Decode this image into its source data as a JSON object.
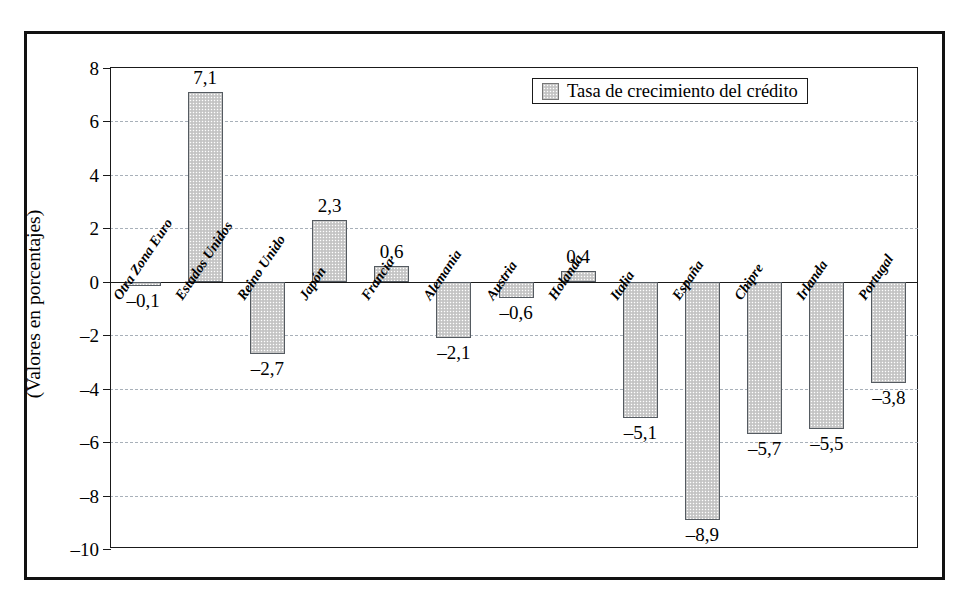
{
  "chart_data": {
    "type": "bar",
    "title": "",
    "subtitle": "",
    "xlabel": "",
    "ylabel": "(Valores en porcentajes)",
    "ylim": [
      -10,
      8
    ],
    "ytick_step": 2,
    "yticks": [
      "8",
      "6",
      "4",
      "2",
      "0",
      "–2",
      "–4",
      "–6",
      "–8",
      "–10"
    ],
    "grid": true,
    "grid_style": "dashed horizontal",
    "legend_position": "top-right inside",
    "decimal_separator": ",",
    "categories": [
      "Otra Zona Euro",
      "Estados Unidos",
      "Reino Unido",
      "Japón",
      "Francia",
      "Alemania",
      "Austria",
      "Holanda",
      "Italia",
      "España",
      "Chipre",
      "Irlanda",
      "Portugal"
    ],
    "values": [
      -0.1,
      7.1,
      -2.7,
      2.3,
      0.6,
      -2.1,
      -0.6,
      0.4,
      -5.1,
      -8.9,
      -5.7,
      -5.5,
      -3.8
    ],
    "value_labels": [
      "–0,1",
      "7,1",
      "–2,7",
      "2,3",
      "0,6",
      "–2,1",
      "–0,6",
      "0,4",
      "–5,1",
      "–8,9",
      "–5,7",
      "–5,5",
      "–3,8"
    ],
    "series": [
      {
        "name": "Tasa de crecimiento del crédito",
        "values": [
          -0.1,
          7.1,
          -2.7,
          2.3,
          0.6,
          -2.1,
          -0.6,
          0.4,
          -5.1,
          -8.9,
          -5.7,
          -5.5,
          -3.8
        ],
        "color": "#cdcdcd",
        "edge_color": "#555b61"
      }
    ],
    "legend": [
      "Tasa de crecimiento del crédito"
    ]
  },
  "legend": {
    "label": "Tasa de crecimiento del crédito",
    "swatch": "stippled-gray-square"
  },
  "axis": {
    "y_title": "(Valores en porcentajes)"
  }
}
